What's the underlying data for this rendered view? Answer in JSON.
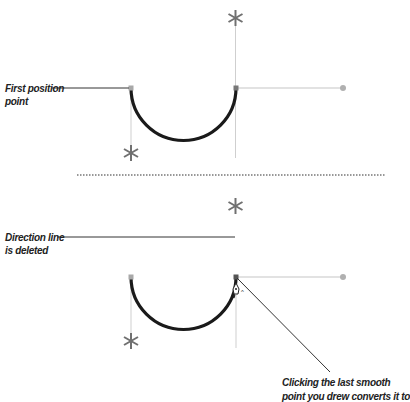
{
  "figure": {
    "top_cut_text": "… … … …",
    "panel_top": {
      "label_line1": "First position",
      "label_line2": "point"
    },
    "panel_bottom": {
      "label_line1": "Direction line",
      "label_line2": "is deleted",
      "caption_line1": "Clicking the last smooth",
      "caption_line2": "point you drew converts it to"
    },
    "colors": {
      "path": "#1a1a1a",
      "handle": "#d8d8d8",
      "anchor": "#a8a8a8",
      "asterisk": "#707070",
      "leader": "#333333"
    }
  }
}
